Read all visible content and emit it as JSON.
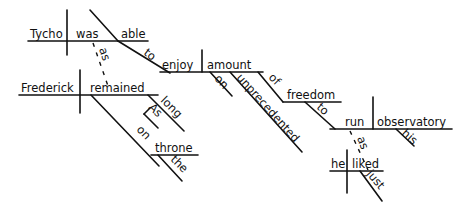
{
  "diagram": {
    "type": "reed-kellogg-sentence-diagram",
    "sentence_words": {
      "subject_main": "Tycho",
      "verb_main": "was",
      "predicate_adjective": "able",
      "infinitive_marker": "to",
      "infinitive_verb": "enjoy",
      "object": "amount",
      "modifier_on": "on",
      "modifier_unprecedented": "unprecedented",
      "prep_of": "of",
      "object_freedom": "freedom",
      "infinitive_to2": "to",
      "verb_run": "run",
      "object_observatory": "observatory",
      "modifier_his": "his",
      "conj_as1": "as",
      "subject_frederick": "Frederick",
      "verb_remained": "remained",
      "adverb_long": "long",
      "adverb_as": "As",
      "prep_on": "on",
      "object_throne": "throne",
      "article_the": "the",
      "conj_as2": "as",
      "subject_he": "he",
      "verb_liked": "liked",
      "adverb_just": "just"
    },
    "colors": {
      "ink": "#111111",
      "background": "#ffffff"
    }
  }
}
